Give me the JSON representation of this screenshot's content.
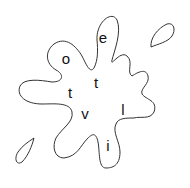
{
  "puzzle": {
    "type": "letter-scramble-splat",
    "letters": [
      {
        "char": "e",
        "x": 103,
        "y": 37
      },
      {
        "char": "o",
        "x": 66,
        "y": 58
      },
      {
        "char": "t",
        "x": 96,
        "y": 82
      },
      {
        "char": "t",
        "x": 70,
        "y": 92
      },
      {
        "char": "v",
        "x": 85,
        "y": 113
      },
      {
        "char": "l",
        "x": 123,
        "y": 109
      },
      {
        "char": "i",
        "x": 108,
        "y": 145
      }
    ],
    "colors": {
      "outline": "#333333",
      "text": "#111111",
      "background": "#ffffff"
    }
  }
}
